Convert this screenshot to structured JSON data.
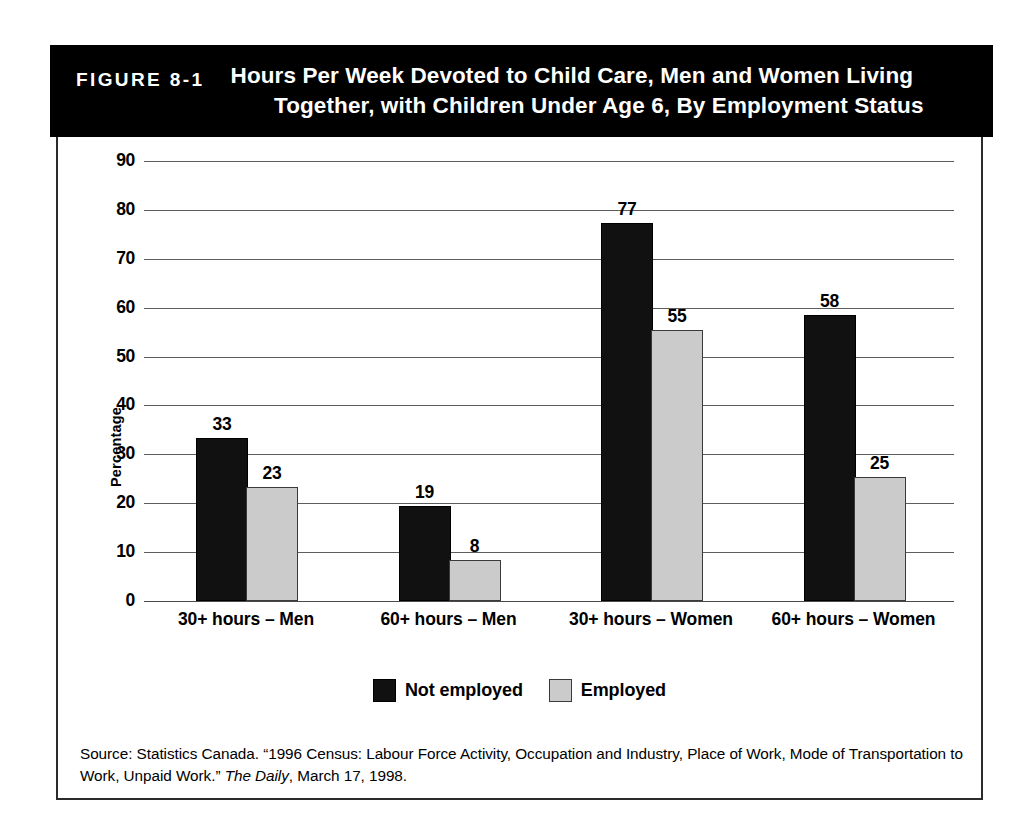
{
  "figure": {
    "number_label": "FIGURE 8-1",
    "title_line_1": "Hours Per Week Devoted to Child Care, Men and Women Living",
    "title_line_2": "Together, with Children Under Age 6, By Employment Status",
    "source_prefix": "Source: Statistics Canada. “1996 Census: Labour Force Activity, Occupation and Industry, Place of Work, Mode of Transportation to Work, Unpaid Work.” ",
    "source_italic": "The Daily",
    "source_suffix": ", March 17, 1998."
  },
  "colors": {
    "banner_background": "#000000",
    "banner_text": "#ffffff",
    "series_not_employed": "#111111",
    "series_employed": "#cbcbcb",
    "gridline": "#5d5d5d",
    "frame_border": "#2b2b2b"
  },
  "chart_data": {
    "type": "bar",
    "title": "Hours Per Week Devoted to Child Care, Men and Women Living Together, with Children Under Age 6, By Employment Status",
    "xlabel": "",
    "ylabel": "Percentage",
    "ylim": [
      0,
      90
    ],
    "yticks": [
      0,
      10,
      20,
      30,
      40,
      50,
      60,
      70,
      80,
      90
    ],
    "ytick_labels": [
      "0",
      "10",
      "20",
      "30",
      "40",
      "50",
      "60",
      "70",
      "80",
      "90"
    ],
    "grid": "horizontal",
    "legend_position": "bottom-center",
    "categories": [
      "30+ hours – Men",
      "60+ hours – Men",
      "30+ hours – Women",
      "60+ hours – Women"
    ],
    "series": [
      {
        "name": "Not employed",
        "color": "#111111",
        "values": [
          33,
          19,
          77,
          58
        ]
      },
      {
        "name": "Employed",
        "color": "#cbcbcb",
        "values": [
          23,
          8,
          55,
          25
        ]
      }
    ]
  }
}
